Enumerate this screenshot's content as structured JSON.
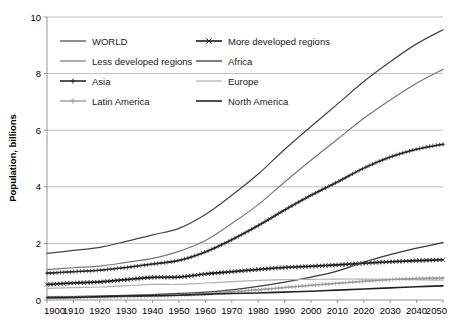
{
  "chart_data": {
    "type": "line",
    "title": "",
    "xlabel": "",
    "ylabel": "Population, billions",
    "xlim": [
      1900,
      2050
    ],
    "ylim": [
      0,
      10
    ],
    "grid": true,
    "legend_position": "top-left-inside",
    "x": [
      1900,
      1910,
      1920,
      1930,
      1940,
      1950,
      1960,
      1970,
      1980,
      1990,
      2000,
      2010,
      2020,
      2030,
      2040,
      2050
    ],
    "xticks": [
      "1900",
      "1910",
      "1920",
      "1930",
      "1940",
      "1950",
      "1960",
      "1970",
      "1980",
      "1990",
      "2000",
      "2010",
      "2020",
      "2030",
      "2040",
      "2050"
    ],
    "yticks": [
      "0",
      "2",
      "4",
      "6",
      "8",
      "10"
    ],
    "series": [
      {
        "name": "WORLD",
        "marker": "none",
        "color": "#444444",
        "width": 1.2,
        "values": [
          1.65,
          1.75,
          1.86,
          2.07,
          2.3,
          2.53,
          3.02,
          3.7,
          4.45,
          5.32,
          6.13,
          6.92,
          7.72,
          8.42,
          9.05,
          9.55
        ]
      },
      {
        "name": "More developed regions",
        "marker": "x",
        "color": "#1a1a1a",
        "width": 1.6,
        "values": [
          0.55,
          0.6,
          0.64,
          0.72,
          0.8,
          0.81,
          0.92,
          1.0,
          1.08,
          1.15,
          1.19,
          1.24,
          1.3,
          1.35,
          1.39,
          1.42
        ]
      },
      {
        "name": "Less developed regions",
        "marker": "none",
        "color": "#777777",
        "width": 1.2,
        "values": [
          1.07,
          1.14,
          1.2,
          1.33,
          1.47,
          1.72,
          2.1,
          2.7,
          3.37,
          4.17,
          4.94,
          5.68,
          6.42,
          7.07,
          7.66,
          8.15
        ]
      },
      {
        "name": "Africa",
        "marker": "none",
        "color": "#3a3a3a",
        "width": 1.3,
        "values": [
          0.11,
          0.12,
          0.14,
          0.16,
          0.19,
          0.23,
          0.28,
          0.36,
          0.48,
          0.63,
          0.81,
          1.02,
          1.34,
          1.6,
          1.83,
          2.03
        ]
      },
      {
        "name": "Asia",
        "marker": "plus",
        "color": "#2a2a2a",
        "width": 1.6,
        "values": [
          0.95,
          1.0,
          1.05,
          1.15,
          1.27,
          1.4,
          1.7,
          2.13,
          2.63,
          3.18,
          3.7,
          4.17,
          4.66,
          5.05,
          5.33,
          5.5
        ]
      },
      {
        "name": "Europe",
        "marker": "none",
        "color": "#b0b0b0",
        "width": 1.2,
        "values": [
          0.41,
          0.44,
          0.46,
          0.5,
          0.55,
          0.55,
          0.6,
          0.65,
          0.69,
          0.72,
          0.73,
          0.74,
          0.74,
          0.73,
          0.72,
          0.7
        ]
      },
      {
        "name": "Latin America",
        "marker": "plus",
        "color": "#9a9a9a",
        "width": 1.4,
        "values": [
          0.08,
          0.09,
          0.1,
          0.12,
          0.14,
          0.17,
          0.22,
          0.29,
          0.36,
          0.44,
          0.52,
          0.59,
          0.66,
          0.72,
          0.76,
          0.78
        ]
      },
      {
        "name": "North America",
        "marker": "none",
        "color": "#222222",
        "width": 1.6,
        "values": [
          0.08,
          0.09,
          0.12,
          0.14,
          0.15,
          0.17,
          0.2,
          0.23,
          0.25,
          0.28,
          0.31,
          0.35,
          0.39,
          0.43,
          0.47,
          0.5
        ]
      }
    ]
  },
  "legend": {
    "items": [
      {
        "label": "WORLD",
        "column": 0,
        "row": 0
      },
      {
        "label": "More developed regions",
        "column": 1,
        "row": 0
      },
      {
        "label": "Less developed regions",
        "column": 0,
        "row": 1
      },
      {
        "label": "Africa",
        "column": 1,
        "row": 1
      },
      {
        "label": "Asia",
        "column": 0,
        "row": 2
      },
      {
        "label": "Europe",
        "column": 1,
        "row": 2
      },
      {
        "label": "Latin America",
        "column": 0,
        "row": 3
      },
      {
        "label": "North America",
        "column": 1,
        "row": 3
      }
    ]
  },
  "axes": {
    "y_title": "Population, billions"
  }
}
